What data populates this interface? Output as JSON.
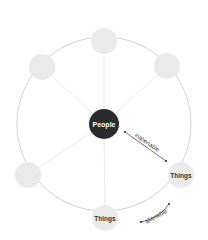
{
  "diagram": {
    "center_node": {
      "label": "People",
      "fill": "#2b2b2b",
      "text_color": "#ffffff"
    },
    "outer_nodes": [
      {
        "label": "",
        "position": "top"
      },
      {
        "label": "",
        "position": "top-right"
      },
      {
        "label": "Things",
        "position": "right"
      },
      {
        "label": "Things",
        "position": "bottom"
      },
      {
        "label": "",
        "position": "left"
      },
      {
        "label": "",
        "position": "top-left"
      }
    ],
    "arrows": [
      {
        "label": "inalienable",
        "from": "People",
        "to": "Things (right)"
      },
      {
        "label": "alienable",
        "from": "Things (right)",
        "to": "Things (bottom)"
      }
    ],
    "colors": {
      "ring": "#d0d0d0",
      "node_fill": "#ececec",
      "spoke": "#e6e6e6"
    }
  }
}
